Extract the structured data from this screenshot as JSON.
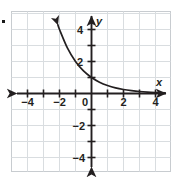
{
  "figure": {
    "name": "coordinate-grid-exponential-decay",
    "bullet_marker": "▪",
    "background_color": "#ffffff",
    "grid_color": "#d9dde0",
    "grid_border_color": "#c8ccd0",
    "axis_color": "#231f20",
    "curve_color": "#231f20"
  },
  "chart_data": {
    "type": "line",
    "title": "",
    "xlabel": "x",
    "ylabel": "y",
    "xlim": [
      -5,
      5
    ],
    "ylim": [
      -5,
      5
    ],
    "grid": true,
    "grid_step": 1,
    "legend": "none",
    "x_tick_labels": [
      "-4",
      "-2",
      "0",
      "2",
      "4"
    ],
    "x_tick_values": [
      -4,
      -2,
      0,
      2,
      4
    ],
    "y_tick_labels": [
      "4",
      "2",
      "-2",
      "-4"
    ],
    "y_tick_values": [
      4,
      2,
      -2,
      -4
    ],
    "series": [
      {
        "name": "exponential-decay",
        "equation": "y = 2^(-x)",
        "x": [
          -2.1,
          -2,
          -1.5,
          -1,
          -0.5,
          0,
          0.5,
          1,
          1.5,
          2,
          2.5,
          3,
          3.5,
          4,
          4.6
        ],
        "y": [
          4.29,
          4,
          2.83,
          2,
          1.41,
          1,
          0.71,
          0.5,
          0.35,
          0.25,
          0.18,
          0.125,
          0.088,
          0.0625,
          0.041
        ],
        "arrow_start": true,
        "arrow_end": false
      }
    ],
    "annotations": [
      {
        "text": "x",
        "x": 4.6,
        "y": 0.75,
        "role": "x-axis-label"
      },
      {
        "text": "y",
        "x": 0.45,
        "y": 4.5,
        "role": "y-axis-label"
      }
    ]
  }
}
